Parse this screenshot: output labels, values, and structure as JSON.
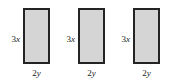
{
  "figure": {
    "type": "geometry-diagram",
    "background_color": "#ffffff",
    "rectangle_fill_color": "#d5d5d5",
    "rectangle_border_color": "#242424",
    "text_color": "#1a1a1a",
    "rectangles": [
      {
        "name": "rectangle-1",
        "height_label": {
          "coefficient": "3",
          "variable": "x"
        },
        "width_label": {
          "coefficient": "2",
          "variable": "y"
        }
      },
      {
        "name": "rectangle-2",
        "height_label": {
          "coefficient": "3",
          "variable": "x"
        },
        "width_label": {
          "coefficient": "2",
          "variable": "y"
        }
      },
      {
        "name": "rectangle-3",
        "height_label": {
          "coefficient": "3",
          "variable": "x"
        },
        "width_label": {
          "coefficient": "2",
          "variable": "y"
        }
      }
    ]
  }
}
